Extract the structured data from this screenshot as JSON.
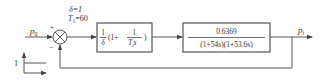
{
  "diagram": {
    "type": "control-block-diagram",
    "input_label": "p",
    "input_sub": "0",
    "output_label": "p",
    "output_sub": "i",
    "summing_junction": {
      "plus_sign": "+",
      "minus_sign": "−"
    },
    "parameters": {
      "delta": "δ=1",
      "t1_name": "T",
      "t1_sub": "1",
      "t1_value": "=60"
    },
    "controller_block": {
      "frac_num": "1",
      "frac_den": "δ",
      "open": "(1+",
      "inner_num": "1",
      "inner_den_T": "T",
      "inner_den_sub": "i",
      "inner_den_s": "s",
      "close": ")"
    },
    "plant_block": {
      "numerator": "0.6369",
      "denominator": "(1+54s)(1+53.6s)"
    },
    "step_input": {
      "amplitude_label": "1"
    }
  }
}
